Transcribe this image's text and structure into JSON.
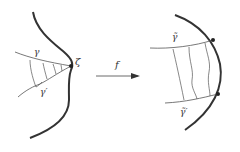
{
  "diagram": {
    "left": {
      "boundary_point_label": "ζ",
      "curve1_label": "γ",
      "curve2_label": "γ′"
    },
    "arrow": {
      "label": "f"
    },
    "right": {
      "curve1_label": "γ̃",
      "curve2_label": "γ̃′"
    }
  },
  "colors": {
    "stroke": "#333333",
    "thin_stroke": "#555555",
    "background": "#ffffff"
  }
}
